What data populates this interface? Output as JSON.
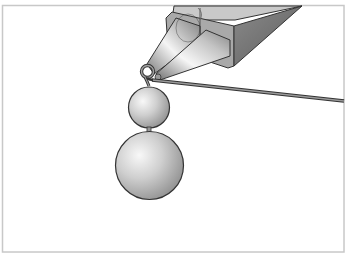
{
  "illustration": {
    "subject": "round-nose pliers forming a wire loop above two beads",
    "colors": {
      "background": "#ffffff",
      "frame_border": "#c8c8c8",
      "outline": "#333333",
      "metal_light": "#f2f2f2",
      "metal_mid": "#b8b8b8",
      "metal_dark": "#6e6e6e",
      "block_top": "#c4c4c4",
      "block_side": "#7a7a7a",
      "block_front": "#a8a8a8",
      "wire": "#8a8a8a",
      "bead_light": "#f4f4f4",
      "bead_mid": "#c2c2c2",
      "bead_dark": "#8e8e8e"
    },
    "elements": {
      "pliers": "round-nose-pliers",
      "loop": "wire-loop",
      "wire": "straight-wire",
      "bead_small": "small-round-bead",
      "bead_large": "large-round-bead"
    }
  }
}
